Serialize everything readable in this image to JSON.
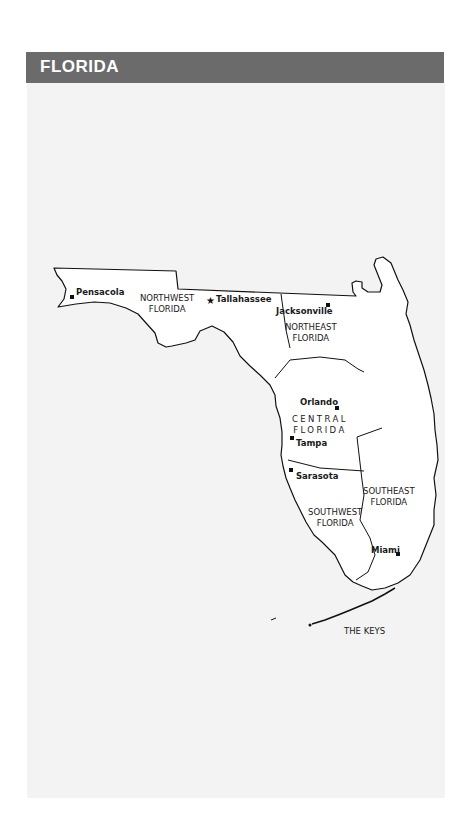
{
  "header": {
    "title": "FLORIDA",
    "bg_color": "#6b6b6b"
  },
  "map": {
    "cities": [
      {
        "name": "Pensacola",
        "marker": "square"
      },
      {
        "name": "Tallahassee",
        "marker": "star"
      },
      {
        "name": "Jacksonville",
        "marker": "square"
      },
      {
        "name": "Orlando",
        "marker": "square"
      },
      {
        "name": "Tampa",
        "marker": "square"
      },
      {
        "name": "Sarasota",
        "marker": "square"
      },
      {
        "name": "Miami",
        "marker": "square"
      }
    ],
    "regions": [
      {
        "line1": "NORTHWEST",
        "line2": "FLORIDA"
      },
      {
        "line1": "NORTHEAST",
        "line2": "FLORIDA"
      },
      {
        "line1": "CENTRAL",
        "line2": "FLORIDA"
      },
      {
        "line1": "SOUTHEAST",
        "line2": "FLORIDA"
      },
      {
        "line1": "SOUTHWEST",
        "line2": "FLORIDA"
      },
      {
        "line1": "THE KEYS",
        "line2": ""
      }
    ]
  }
}
